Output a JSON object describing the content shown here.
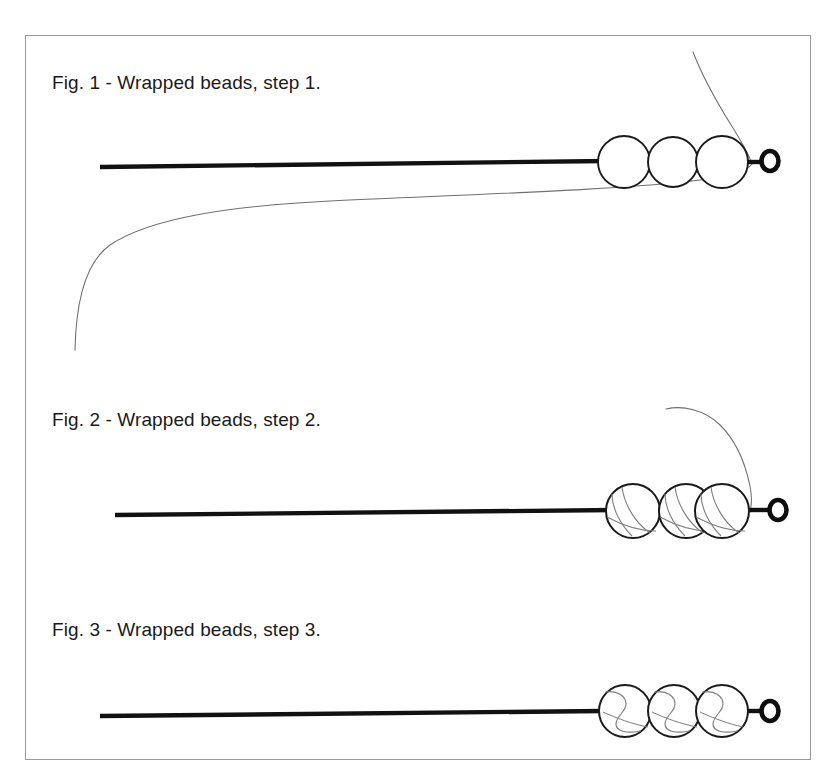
{
  "document": {
    "type": "instructional-diagram-sheet",
    "background_color": "#ffffff",
    "border_color": "#9a9a9a"
  },
  "figures": [
    {
      "id": "fig-1",
      "caption": "Fig. 1 - Wrapped beads, step 1.",
      "step": 1,
      "bead_count": 3,
      "bead_style": "plain",
      "thread_visible": true,
      "thread_description": "loose thread curving from upper right down and sweeping to lower left",
      "wire_color": "#111111",
      "thread_color": "#6b6b6b"
    },
    {
      "id": "fig-2",
      "caption": "Fig. 2 - Wrapped beads, step 2.",
      "step": 2,
      "bead_count": 3,
      "bead_style": "partially-wrapped",
      "thread_visible": true,
      "thread_description": "thread arcs from above into the right bead, diagonal wraps across each bead",
      "wire_color": "#111111",
      "thread_color": "#6b6b6b"
    },
    {
      "id": "fig-3",
      "caption": "Fig. 3 - Wrapped beads, step 3.",
      "step": 3,
      "bead_count": 3,
      "bead_style": "fully-wrapped",
      "thread_visible": false,
      "thread_description": "S-shaped wrapped thread contained within each bead",
      "wire_color": "#111111",
      "thread_color": "#6b6b6b"
    }
  ],
  "elements": {
    "wire_label": "headpin wire",
    "eye_loop_label": "wire eye loop",
    "bead_label": "bead"
  }
}
